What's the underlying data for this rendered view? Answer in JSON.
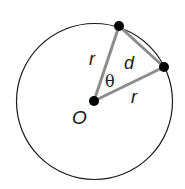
{
  "diagram": {
    "title": "",
    "circle": {
      "cx": 94.5,
      "cy": 101.5,
      "r": 78,
      "stroke": "#1a1a1a"
    },
    "center": {
      "label": "O",
      "x": 94,
      "y": 101
    },
    "points": [
      {
        "name": "top-point",
        "x": 119,
        "y": 26
      },
      {
        "name": "right-point",
        "x": 164,
        "y": 67
      }
    ],
    "segments": [
      {
        "name": "radius-1",
        "label": "r"
      },
      {
        "name": "radius-2",
        "label": "r"
      },
      {
        "name": "chord",
        "label": "d"
      }
    ],
    "angle_label": "θ",
    "segment_color": "#8c8c8c",
    "point_color": "#000000"
  }
}
